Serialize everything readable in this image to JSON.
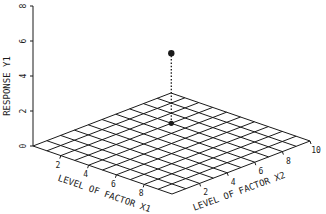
{
  "chart_data": {
    "type": "scatter",
    "subtype": "3d-response-surface-point",
    "title": "",
    "zlabel": "RESPONSE Y1",
    "x1label": "LEVEL OF FACTOR X1",
    "x2label": "LEVEL OF FACTOR X2",
    "z_ticks": [
      "0",
      "2",
      "4",
      "6",
      "8"
    ],
    "z_tick_values": [
      0,
      2,
      4,
      6,
      8
    ],
    "x1_ticks": [
      "2",
      "4",
      "6",
      "8"
    ],
    "x1_tick_values": [
      2,
      4,
      6,
      8
    ],
    "x2_ticks": [
      "2",
      "4",
      "6",
      "8",
      "10"
    ],
    "x2_tick_values": [
      2,
      4,
      6,
      8,
      10
    ],
    "x1_range": [
      0,
      10
    ],
    "x2_range": [
      0,
      10
    ],
    "z_range": [
      0,
      8
    ],
    "grid": true,
    "grid_divisions": 10,
    "points": [
      {
        "x1": 3,
        "x2": 7,
        "y": 4
      }
    ],
    "projection_line": "dotted",
    "base_marker": true
  },
  "colors": {
    "ink": "#1a1a1a",
    "background": "#ffffff"
  }
}
